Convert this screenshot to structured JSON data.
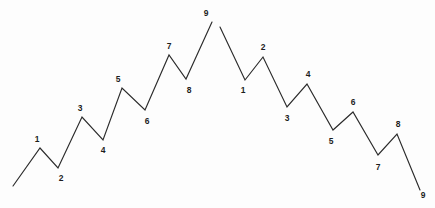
{
  "figure": {
    "background_color": "#fdfdfd",
    "stroke_color": "#2b2b2b",
    "label_color": "#1d1d1d",
    "width": 435,
    "height": 208
  },
  "chart_data": {
    "type": "line",
    "subtitle": "",
    "xlabel": "",
    "ylabel": "",
    "xlim": [
      0,
      435
    ],
    "ylim": [
      208,
      0
    ],
    "grid": false,
    "legend": null,
    "note": "Two separate zig-zag polylines drawn in screen pixel coordinates (y increases downward). The left polyline rises in a 9-pivot advance; the right polyline falls in a 9-pivot decline. The two polylines are not joined at the top; a small gap separates them.",
    "series": [
      {
        "name": "ascending-wave",
        "stroke": "#2b2b2b",
        "points": [
          {
            "x": 13,
            "y": 186,
            "label": null
          },
          {
            "x": 40,
            "y": 148,
            "label": "1"
          },
          {
            "x": 58,
            "y": 168,
            "label": "2"
          },
          {
            "x": 82,
            "y": 117,
            "label": "3"
          },
          {
            "x": 103,
            "y": 140,
            "label": "4"
          },
          {
            "x": 122,
            "y": 88,
            "label": "5"
          },
          {
            "x": 145,
            "y": 110,
            "label": "6"
          },
          {
            "x": 169,
            "y": 55,
            "label": "7"
          },
          {
            "x": 186,
            "y": 79,
            "label": "8"
          },
          {
            "x": 212,
            "y": 22,
            "label": "9"
          }
        ]
      },
      {
        "name": "descending-wave",
        "stroke": "#2b2b2b",
        "points": [
          {
            "x": 220,
            "y": 27,
            "label": null
          },
          {
            "x": 245,
            "y": 80,
            "label": "1"
          },
          {
            "x": 263,
            "y": 57,
            "label": "2"
          },
          {
            "x": 287,
            "y": 107,
            "label": "3"
          },
          {
            "x": 307,
            "y": 84,
            "label": "4"
          },
          {
            "x": 333,
            "y": 130,
            "label": "5"
          },
          {
            "x": 353,
            "y": 112,
            "label": "6"
          },
          {
            "x": 378,
            "y": 155,
            "label": "7"
          },
          {
            "x": 397,
            "y": 134,
            "label": "8"
          },
          {
            "x": 420,
            "y": 190,
            "label": "9"
          }
        ]
      }
    ]
  },
  "labels": {
    "ascending": [
      {
        "text": "1",
        "x": 37,
        "y": 139
      },
      {
        "text": "2",
        "x": 61,
        "y": 178
      },
      {
        "text": "3",
        "x": 80,
        "y": 108
      },
      {
        "text": "4",
        "x": 103,
        "y": 150
      },
      {
        "text": "5",
        "x": 118,
        "y": 79
      },
      {
        "text": "6",
        "x": 147,
        "y": 121
      },
      {
        "text": "7",
        "x": 169,
        "y": 46
      },
      {
        "text": "8",
        "x": 189,
        "y": 90
      },
      {
        "text": "9",
        "x": 206,
        "y": 13
      }
    ],
    "descending": [
      {
        "text": "1",
        "x": 243,
        "y": 90
      },
      {
        "text": "2",
        "x": 263,
        "y": 47
      },
      {
        "text": "3",
        "x": 287,
        "y": 118
      },
      {
        "text": "4",
        "x": 308,
        "y": 74
      },
      {
        "text": "5",
        "x": 331,
        "y": 141
      },
      {
        "text": "6",
        "x": 353,
        "y": 102
      },
      {
        "text": "7",
        "x": 378,
        "y": 167
      },
      {
        "text": "8",
        "x": 398,
        "y": 124
      },
      {
        "text": "9",
        "x": 423,
        "y": 195
      }
    ]
  }
}
